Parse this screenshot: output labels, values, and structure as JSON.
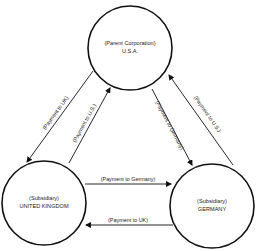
{
  "diagram": {
    "colors": {
      "stroke": "#111111",
      "background": "#ffffff",
      "text": "#1a1a1a"
    },
    "nodes": [
      {
        "id": "usa",
        "role": "(Parent Corporation)",
        "name": "U.S.A."
      },
      {
        "id": "uk",
        "role": "(Subsidiary)",
        "name": "UNITED KINGDOM"
      },
      {
        "id": "germany",
        "role": "(Subsidiary)",
        "name": "GERMANY"
      }
    ],
    "edges": [
      {
        "from": "usa",
        "to": "uk",
        "label": "(Payment to UK)"
      },
      {
        "from": "uk",
        "to": "usa",
        "label": "(Payment to U.S.)"
      },
      {
        "from": "usa",
        "to": "germany",
        "label": "(Payment to Germany)"
      },
      {
        "from": "germany",
        "to": "usa",
        "label": "(Payment to U.S.)"
      },
      {
        "from": "uk",
        "to": "germany",
        "label": "(Payment to Germany)"
      },
      {
        "from": "germany",
        "to": "uk",
        "label": "(Payment to UK)"
      }
    ]
  }
}
